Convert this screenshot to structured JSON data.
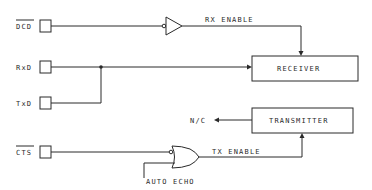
{
  "diagram": {
    "type": "block-diagram",
    "pins": [
      {
        "id": "dcd",
        "label": "DCD",
        "overbar": true
      },
      {
        "id": "rxd",
        "label": "RxD",
        "overbar": false
      },
      {
        "id": "txd",
        "label": "TxD",
        "overbar": false
      },
      {
        "id": "cts",
        "label": "CTS",
        "overbar": true
      }
    ],
    "blocks": [
      {
        "id": "receiver",
        "label": "RECEIVER"
      },
      {
        "id": "transmitter",
        "label": "TRANSMITTER"
      }
    ],
    "gates": [
      {
        "id": "buffer",
        "type": "inverting-input buffer"
      },
      {
        "id": "or-gate",
        "type": "OR with inverted input"
      }
    ],
    "signals": {
      "rx_enable": "RX ENABLE",
      "tx_enable": "TX ENABLE",
      "nc": "N/C",
      "auto_echo": "AUTO ECHO"
    },
    "colors": {
      "line": "#2a2a2a",
      "background": "#ffffff"
    }
  }
}
